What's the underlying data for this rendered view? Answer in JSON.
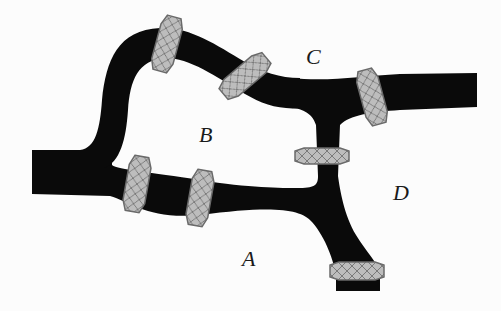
{
  "diagram": {
    "colors": {
      "background": "#fcfcfc",
      "pipe": "#0a0a0a",
      "ring_fill": "#b9b9b9",
      "ring_stroke": "#6a6a6a",
      "ring_hatch": "#7a7a7a",
      "label": "#1a1a1a"
    },
    "regions": [
      {
        "id": "A",
        "label": "A",
        "x": 242,
        "y": 250
      },
      {
        "id": "B",
        "label": "B",
        "x": 199,
        "y": 125
      },
      {
        "id": "C",
        "label": "C",
        "x": 307,
        "y": 47
      },
      {
        "id": "D",
        "label": "D",
        "x": 394,
        "y": 183
      }
    ],
    "rings": [
      {
        "id": "ring-top-left",
        "cx": 167,
        "cy": 44,
        "angle": 15
      },
      {
        "id": "ring-top-middle",
        "cx": 245,
        "cy": 76,
        "angle": 50
      },
      {
        "id": "ring-c-right",
        "cx": 372,
        "cy": 97,
        "angle": -15
      },
      {
        "id": "ring-connector",
        "cx": 322,
        "cy": 156,
        "angle": 90
      },
      {
        "id": "ring-a-left",
        "cx": 137,
        "cy": 184,
        "angle": 10
      },
      {
        "id": "ring-a-right",
        "cx": 200,
        "cy": 198,
        "angle": 10
      },
      {
        "id": "ring-bottom",
        "cx": 357,
        "cy": 271,
        "angle": 90
      }
    ]
  }
}
